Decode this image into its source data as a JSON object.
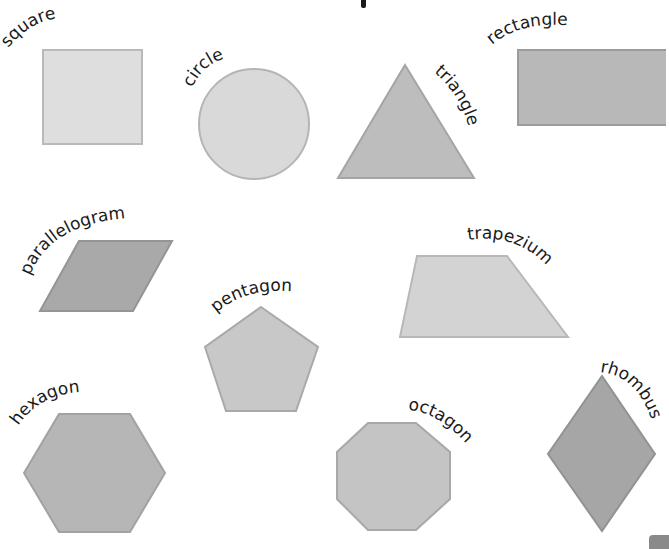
{
  "worksheet": {
    "title_visible_fragment": "|",
    "stroke_color": "#a3a3a3",
    "shapes": [
      {
        "name": "square",
        "label": "square",
        "fill": "#dedede"
      },
      {
        "name": "circle",
        "label": "circle",
        "fill": "#d9d9d9"
      },
      {
        "name": "triangle",
        "label": "triangle",
        "fill": "#bdbdbd"
      },
      {
        "name": "rectangle",
        "label": "rectangle",
        "fill": "#b8b8b8"
      },
      {
        "name": "parallelogram",
        "label": "parallelogram",
        "fill": "#a9a9a9"
      },
      {
        "name": "trapezium",
        "label": "trapezium",
        "fill": "#d3d3d3"
      },
      {
        "name": "pentagon",
        "label": "pentagon",
        "fill": "#c8c8c8"
      },
      {
        "name": "hexagon",
        "label": "hexagon",
        "fill": "#b6b6b6"
      },
      {
        "name": "octagon",
        "label": "octagon",
        "fill": "#c4c4c4"
      },
      {
        "name": "rhombus",
        "label": "rhombus",
        "fill": "#a6a6a6"
      }
    ]
  }
}
